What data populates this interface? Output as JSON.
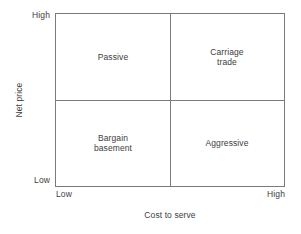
{
  "chart_data": {
    "type": "table",
    "title": "",
    "xlabel": "Cost to serve",
    "ylabel": "Net price",
    "grid": false,
    "legend": "none",
    "x_ticks": [
      "Low",
      "High"
    ],
    "y_ticks": [
      "Low",
      "High"
    ],
    "xlim": [
      "Low",
      "High"
    ],
    "ylim": [
      "Low",
      "High"
    ],
    "quadrants": [
      {
        "key": "passive",
        "label": "Passive",
        "x_position": "low",
        "y_position": "high",
        "corner": "top-left"
      },
      {
        "key": "carriage-trade",
        "label": "Carriage\ntrade",
        "x_position": "high",
        "y_position": "high",
        "corner": "top-right"
      },
      {
        "key": "bargain-basement",
        "label": "Bargain\nbasement",
        "x_position": "low",
        "y_position": "low",
        "corner": "bottom-left"
      },
      {
        "key": "aggressive",
        "label": "Aggressive",
        "x_position": "high",
        "y_position": "low",
        "corner": "bottom-right"
      }
    ],
    "colors": {
      "line": "#7a7a7a",
      "text": "#3d3d3d",
      "background": "#ffffff"
    }
  },
  "axes": {
    "y": {
      "title": "Net price",
      "tick_high": "High",
      "tick_low": "Low"
    },
    "x": {
      "title": "Cost to serve",
      "tick_low": "Low",
      "tick_high": "High"
    }
  },
  "quadrant_labels": {
    "top_left": "Passive",
    "top_right": "Carriage\ntrade",
    "bottom_left": "Bargain\nbasement",
    "bottom_right": "Aggressive"
  }
}
